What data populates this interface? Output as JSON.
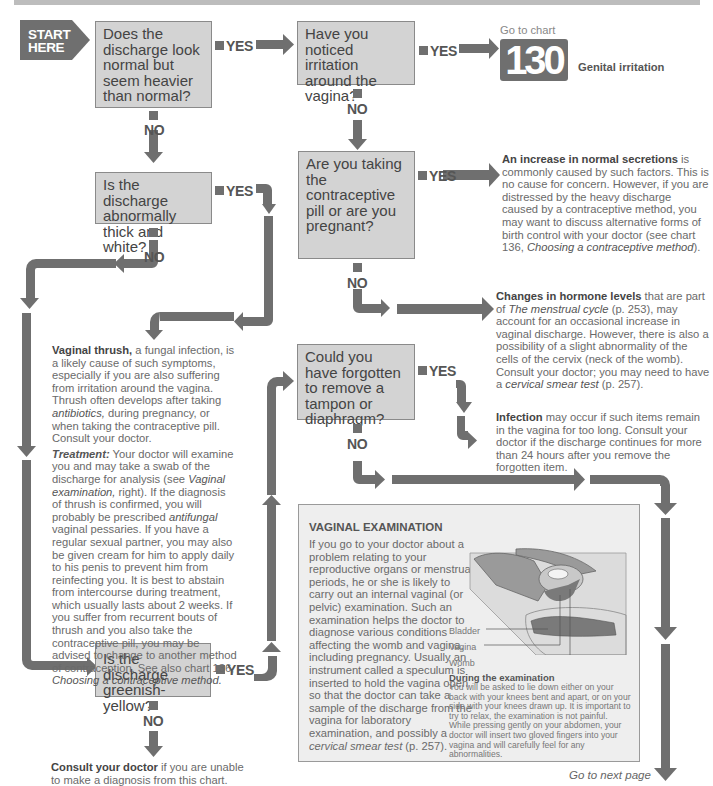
{
  "header": {
    "bar": ""
  },
  "start": {
    "line1": "START",
    "line2": "HERE"
  },
  "questions": {
    "q1": "Does the discharge look normal but seem heavier than normal?",
    "q2": "Have you noticed irritation around the vagina?",
    "q3": "Are you taking the contraceptive pill or are you pregnant?",
    "q4": "Is the discharge abnormally thick and white?",
    "q5": "Could you have forgotten to remove a tampon or diaphragm?",
    "q6": "Is the discharge greenish-yellow?"
  },
  "labels": {
    "yes": "YES",
    "no": "NO"
  },
  "goto_chart": {
    "prefix": "Go to chart",
    "number": "130",
    "title": "Genital irritation"
  },
  "outcomes": {
    "normal_secretions": {
      "bold": "An increase in normal secretions",
      "text1": " is commonly caused by such factors. This is no cause for concern. However, if you are distressed by the heavy discharge caused by a contraceptive method, you may want to discuss alternative forms of birth control with your doctor (see chart 136, ",
      "italic": "Choosing a contraceptive method",
      "text2": ")."
    },
    "hormone_levels": {
      "bold": "Changes in hormone levels",
      "text1": " that are part of ",
      "italic1": "The menstrual cycle",
      "text2": " (p. 253), may account for an occasional increase in vaginal discharge. However, there is also a possibility of a slight abnormality of the cells of the cervix (neck of the womb). Consult your doctor; you may need to have a ",
      "italic2": "cervical smear test",
      "text3": " (p. 257)."
    },
    "infection": {
      "bold": "Infection",
      "text": " may occur if such items remain in the vagina for too long. Consult your doctor if the discharge continues for more than 24 hours after you remove the forgotten item."
    },
    "thrush": {
      "bold": "Vaginal thrush,",
      "text1": " a fungal infection, is a likely cause of such symptoms, especially if you are also suffering from irritation around the vagina. Thrush often develops after taking ",
      "italic1": "antibiotics,",
      "text2": " during pregnancy, or when taking the contraceptive pill. Consult your doctor.",
      "treatment_label": "Treatment:",
      "t1": " Your doctor will examine you and may take a swab of the discharge for analysis (see ",
      "t_italic1": "Vaginal examination,",
      "t2": " right). If the diagnosis of thrush is confirmed, you will probably be prescribed ",
      "t_italic2": "antifungal",
      "t3": " vaginal pessaries. If you have a regular sexual partner, you may also be given cream for him to apply daily to his penis to prevent him from reinfecting you. It is best to abstain from intercourse during treatment, which usually lasts about 2 weeks. If you suffer from recurrent bouts of thrush and you also take the contraceptive pill, you may be advised to change to another method of contraception. See also chart 136, ",
      "t_italic3": "Choosing a contraceptive method."
    },
    "consult": {
      "bold": "Consult your doctor",
      "text": " if you are unable to make a diagnosis from this chart."
    }
  },
  "panel": {
    "title": "VAGINAL EXAMINATION",
    "body1": "If you go to your doctor about a problem relating to your reproductive organs or menstrual periods, he or she is likely to carry out an internal vaginal (or pelvic) examination. Such an examination helps the doctor to diagnose various conditions affecting the womb and vagina, including pregnancy. Usually an instrument called a speculum is inserted to hold the vagina open so that the doctor can take a sample of the discharge from the vagina for laboratory examination, and possibly a ",
    "body_italic": "cervical smear test",
    "body2": " (p. 257).",
    "illustration_labels": [
      "Bladder",
      "Vagina",
      "Womb"
    ],
    "during_title": "During the examination",
    "during_text": "You will be asked to lie down either on your back with your knees bent and apart, or on your side with your knees drawn up. It is important to try to relax, the examination is not painful. While pressing gently on your abdomen, your doctor will insert two gloved fingers into your vagina and will carefully feel for any abnormalities."
  },
  "footer": {
    "next_page": "Go to next page"
  },
  "colors": {
    "arrow": "#6f6f6f",
    "box": "#d3d3d3",
    "panel": "#eeeeee",
    "text": "#6a6a6a"
  }
}
